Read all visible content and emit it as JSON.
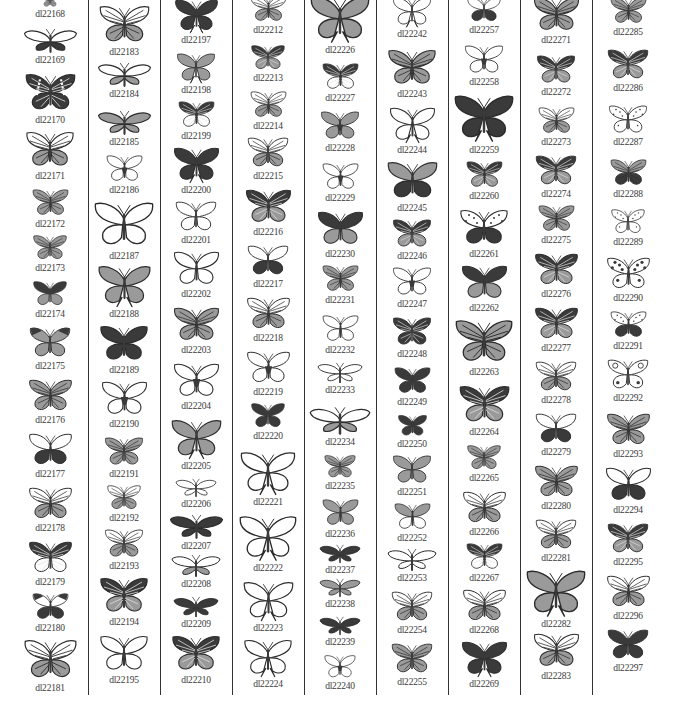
{
  "page": {
    "columns": [
      {
        "items": [
          {
            "id": "dl22168",
            "y": -6,
            "h": 14,
            "style": "pattern"
          },
          {
            "id": "dl22169",
            "y": 28,
            "h": 26,
            "style": "moth-dark"
          },
          {
            "id": "dl22170",
            "y": 72,
            "h": 42,
            "style": "dark-bands"
          },
          {
            "id": "dl22171",
            "y": 130,
            "h": 40,
            "style": "mixed"
          },
          {
            "id": "dl22172",
            "y": 188,
            "h": 30,
            "style": "pattern"
          },
          {
            "id": "dl22173",
            "y": 234,
            "h": 28,
            "style": "pattern"
          },
          {
            "id": "dl22174",
            "y": 280,
            "h": 28,
            "style": "dark-gray"
          },
          {
            "id": "dl22175",
            "y": 326,
            "h": 34,
            "style": "gray-dark-tips"
          },
          {
            "id": "dl22176",
            "y": 378,
            "h": 36,
            "style": "outline-stripe"
          },
          {
            "id": "dl22177",
            "y": 432,
            "h": 36,
            "style": "white-dark-hind"
          },
          {
            "id": "dl22178",
            "y": 486,
            "h": 36,
            "style": "gray-outline"
          },
          {
            "id": "dl22179",
            "y": 540,
            "h": 36,
            "style": "dark-top-white"
          },
          {
            "id": "dl22180",
            "y": 592,
            "h": 30,
            "style": "white-dark"
          },
          {
            "id": "dl22181",
            "y": 638,
            "h": 44,
            "style": "outline-pattern"
          }
        ]
      },
      {
        "items": [
          {
            "id": "dl22183",
            "y": 4,
            "h": 42,
            "style": "outline-pattern"
          },
          {
            "id": "dl22184",
            "y": 62,
            "h": 26,
            "style": "moth-gray"
          },
          {
            "id": "dl22185",
            "y": 110,
            "h": 26,
            "style": "moth-pattern"
          },
          {
            "id": "dl22186",
            "y": 154,
            "h": 30,
            "style": "outline-body"
          },
          {
            "id": "dl22187",
            "y": 200,
            "h": 50,
            "style": "outline"
          },
          {
            "id": "dl22188",
            "y": 264,
            "h": 44,
            "style": "gray-swallow"
          },
          {
            "id": "dl22189",
            "y": 324,
            "h": 40,
            "style": "dark"
          },
          {
            "id": "dl22190",
            "y": 380,
            "h": 38,
            "style": "outline-body"
          },
          {
            "id": "dl22191",
            "y": 436,
            "h": 32,
            "style": "gray-pattern"
          },
          {
            "id": "dl22192",
            "y": 484,
            "h": 28,
            "style": "gray-outline"
          },
          {
            "id": "dl22193",
            "y": 528,
            "h": 32,
            "style": "outline-pattern"
          },
          {
            "id": "dl22194",
            "y": 576,
            "h": 40,
            "style": "dark-pattern"
          },
          {
            "id": "dl22195",
            "y": 634,
            "h": 40,
            "style": "outline"
          }
        ]
      },
      {
        "items": [
          {
            "id": "dl22197",
            "y": -2,
            "h": 36,
            "style": "dark-swallow"
          },
          {
            "id": "dl22198",
            "y": 52,
            "h": 32,
            "style": "gray-swallow"
          },
          {
            "id": "dl22199",
            "y": 100,
            "h": 30,
            "style": "dark-hind-pattern"
          },
          {
            "id": "dl22200",
            "y": 146,
            "h": 38,
            "style": "dark-swallow"
          },
          {
            "id": "dl22201",
            "y": 200,
            "h": 34,
            "style": "outline"
          },
          {
            "id": "dl22202",
            "y": 250,
            "h": 38,
            "style": "outline"
          },
          {
            "id": "dl22203",
            "y": 306,
            "h": 38,
            "style": "gray-pattern"
          },
          {
            "id": "dl22204",
            "y": 362,
            "h": 38,
            "style": "outline-body"
          },
          {
            "id": "dl22205",
            "y": 418,
            "h": 42,
            "style": "gray-swallow"
          },
          {
            "id": "dl22206",
            "y": 478,
            "h": 20,
            "style": "moth-outline"
          },
          {
            "id": "dl22207",
            "y": 514,
            "h": 26,
            "style": "dark-moth"
          },
          {
            "id": "dl22208",
            "y": 554,
            "h": 24,
            "style": "moth-mixed"
          },
          {
            "id": "dl22209",
            "y": 596,
            "h": 22,
            "style": "dark-moth"
          },
          {
            "id": "dl22210",
            "y": 634,
            "h": 40,
            "style": "dark-pattern"
          }
        ]
      },
      {
        "items": [
          {
            "id": "dl22212",
            "y": -6,
            "h": 30,
            "style": "outline-pattern"
          },
          {
            "id": "dl22213",
            "y": 44,
            "h": 28,
            "style": "dark-pattern"
          },
          {
            "id": "dl22214",
            "y": 90,
            "h": 30,
            "style": "mixed"
          },
          {
            "id": "dl22215",
            "y": 136,
            "h": 34,
            "style": "gray-outline"
          },
          {
            "id": "dl22216",
            "y": 188,
            "h": 38,
            "style": "dark-pattern"
          },
          {
            "id": "dl22217",
            "y": 244,
            "h": 34,
            "style": "white-dark-hind"
          },
          {
            "id": "dl22218",
            "y": 296,
            "h": 36,
            "style": "outline-pattern"
          },
          {
            "id": "dl22219",
            "y": 350,
            "h": 36,
            "style": "outline-body"
          },
          {
            "id": "dl22220",
            "y": 402,
            "h": 28,
            "style": "dark"
          },
          {
            "id": "dl22221",
            "y": 450,
            "h": 46,
            "style": "outline-swallow"
          },
          {
            "id": "dl22222",
            "y": 514,
            "h": 48,
            "style": "outline-swallow"
          },
          {
            "id": "dl22223",
            "y": 580,
            "h": 42,
            "style": "outline-swallow"
          },
          {
            "id": "dl22224",
            "y": 638,
            "h": 40,
            "style": "outline-swallow"
          }
        ]
      },
      {
        "items": [
          {
            "id": "dl22226",
            "y": -6,
            "h": 50,
            "style": "gray-swallow"
          },
          {
            "id": "dl22227",
            "y": 62,
            "h": 30,
            "style": "dark-top-white"
          },
          {
            "id": "dl22228",
            "y": 110,
            "h": 32,
            "style": "gray-dark-body"
          },
          {
            "id": "dl22229",
            "y": 162,
            "h": 30,
            "style": "outline-body"
          },
          {
            "id": "dl22230",
            "y": 210,
            "h": 38,
            "style": "dark-gray"
          },
          {
            "id": "dl22231",
            "y": 264,
            "h": 30,
            "style": "gray-pattern"
          },
          {
            "id": "dl22232",
            "y": 314,
            "h": 30,
            "style": "outline"
          },
          {
            "id": "dl22233",
            "y": 362,
            "h": 22,
            "style": "moth-outline"
          },
          {
            "id": "dl22234",
            "y": 406,
            "h": 30,
            "style": "moth-mixed"
          },
          {
            "id": "dl22235",
            "y": 454,
            "h": 26,
            "style": "gray-pattern"
          },
          {
            "id": "dl22236",
            "y": 498,
            "h": 30,
            "style": "gray"
          },
          {
            "id": "dl22237",
            "y": 544,
            "h": 20,
            "style": "dark-moth"
          },
          {
            "id": "dl22238",
            "y": 578,
            "h": 20,
            "style": "moth-pattern"
          },
          {
            "id": "dl22239",
            "y": 616,
            "h": 20,
            "style": "dark-moth"
          },
          {
            "id": "dl22240",
            "y": 654,
            "h": 26,
            "style": "outline-body"
          }
        ]
      },
      {
        "items": [
          {
            "id": "dl22242",
            "y": -4,
            "h": 32,
            "style": "outline-swallow"
          },
          {
            "id": "dl22243",
            "y": 48,
            "h": 40,
            "style": "gray-pattern"
          },
          {
            "id": "dl22244",
            "y": 106,
            "h": 38,
            "style": "outline-swallow"
          },
          {
            "id": "dl22245",
            "y": 160,
            "h": 42,
            "style": "gray-dark-hind"
          },
          {
            "id": "dl22246",
            "y": 218,
            "h": 32,
            "style": "dark-pattern"
          },
          {
            "id": "dl22247",
            "y": 266,
            "h": 32,
            "style": "outline-body"
          },
          {
            "id": "dl22248",
            "y": 316,
            "h": 32,
            "style": "dark-stripe"
          },
          {
            "id": "dl22249",
            "y": 366,
            "h": 30,
            "style": "dark"
          },
          {
            "id": "dl22250",
            "y": 414,
            "h": 24,
            "style": "dark"
          },
          {
            "id": "dl22251",
            "y": 454,
            "h": 32,
            "style": "gray"
          },
          {
            "id": "dl22252",
            "y": 502,
            "h": 30,
            "style": "gray-top-white"
          },
          {
            "id": "dl22253",
            "y": 548,
            "h": 24,
            "style": "moth-outline"
          },
          {
            "id": "dl22254",
            "y": 590,
            "h": 34,
            "style": "mixed"
          },
          {
            "id": "dl22255",
            "y": 642,
            "h": 34,
            "style": "pattern"
          }
        ]
      },
      {
        "items": [
          {
            "id": "dl22257",
            "y": -4,
            "h": 28,
            "style": "white-dark-hind"
          },
          {
            "id": "dl22258",
            "y": 44,
            "h": 32,
            "style": "outline-body"
          },
          {
            "id": "dl22259",
            "y": 92,
            "h": 52,
            "style": "dark-swallow"
          },
          {
            "id": "dl22260",
            "y": 160,
            "h": 30,
            "style": "dark-pattern"
          },
          {
            "id": "dl22261",
            "y": 208,
            "h": 40,
            "style": "dotted-dark-hind"
          },
          {
            "id": "dl22262",
            "y": 264,
            "h": 38,
            "style": "dark-gray"
          },
          {
            "id": "dl22263",
            "y": 318,
            "h": 48,
            "style": "pattern"
          },
          {
            "id": "dl22264",
            "y": 384,
            "h": 42,
            "style": "dark-pattern"
          },
          {
            "id": "dl22265",
            "y": 444,
            "h": 28,
            "style": "gray-pattern"
          },
          {
            "id": "dl22266",
            "y": 490,
            "h": 36,
            "style": "outline-pattern"
          },
          {
            "id": "dl22267",
            "y": 542,
            "h": 30,
            "style": "dark-top-white"
          },
          {
            "id": "dl22268",
            "y": 588,
            "h": 36,
            "style": "gray-outline"
          },
          {
            "id": "dl22269",
            "y": 640,
            "h": 38,
            "style": "dark-swallow"
          }
        ]
      },
      {
        "items": [
          {
            "id": "dl22271",
            "y": -4,
            "h": 38,
            "style": "pattern"
          },
          {
            "id": "dl22272",
            "y": 54,
            "h": 32,
            "style": "dark-pattern"
          },
          {
            "id": "dl22273",
            "y": 106,
            "h": 30,
            "style": "mixed"
          },
          {
            "id": "dl22274",
            "y": 154,
            "h": 34,
            "style": "dark-pattern"
          },
          {
            "id": "dl22275",
            "y": 204,
            "h": 30,
            "style": "pattern"
          },
          {
            "id": "dl22276",
            "y": 252,
            "h": 36,
            "style": "dark-pattern"
          },
          {
            "id": "dl22277",
            "y": 306,
            "h": 36,
            "style": "dark-pattern"
          },
          {
            "id": "dl22278",
            "y": 360,
            "h": 34,
            "style": "outline-pattern"
          },
          {
            "id": "dl22279",
            "y": 412,
            "h": 34,
            "style": "white-dark-hind"
          },
          {
            "id": "dl22280",
            "y": 464,
            "h": 36,
            "style": "gray-pattern"
          },
          {
            "id": "dl22281",
            "y": 518,
            "h": 34,
            "style": "gray-outline"
          },
          {
            "id": "dl22282",
            "y": 568,
            "h": 50,
            "style": "gray-swallow"
          },
          {
            "id": "dl22283",
            "y": 632,
            "h": 38,
            "style": "outline-pattern"
          }
        ]
      },
      {
        "items": [
          {
            "id": "dl22285",
            "y": -4,
            "h": 30,
            "style": "pattern"
          },
          {
            "id": "dl22286",
            "y": 48,
            "h": 34,
            "style": "dark-pattern"
          },
          {
            "id": "dl22287",
            "y": 104,
            "h": 32,
            "style": "dotted"
          },
          {
            "id": "dl22288",
            "y": 158,
            "h": 30,
            "style": "gray-dark"
          },
          {
            "id": "dl22289",
            "y": 208,
            "h": 28,
            "style": "dotted"
          },
          {
            "id": "dl22290",
            "y": 256,
            "h": 36,
            "style": "dotted-dark"
          },
          {
            "id": "dl22291",
            "y": 310,
            "h": 30,
            "style": "dotted-dark-hind"
          },
          {
            "id": "dl22292",
            "y": 358,
            "h": 34,
            "style": "outline-eyes"
          },
          {
            "id": "dl22293",
            "y": 412,
            "h": 36,
            "style": "pattern"
          },
          {
            "id": "dl22294",
            "y": 466,
            "h": 38,
            "style": "white-dark-hind"
          },
          {
            "id": "dl22295",
            "y": 522,
            "h": 34,
            "style": "dark-pattern"
          },
          {
            "id": "dl22296",
            "y": 574,
            "h": 36,
            "style": "mixed"
          },
          {
            "id": "dl22297",
            "y": 628,
            "h": 34,
            "style": "dark"
          }
        ]
      }
    ],
    "colors": {
      "dark": "#3a3a3a",
      "gray": "#9a9a9a",
      "light": "#ffffff",
      "line": "#2b2b2b",
      "label": "#3a3a3a"
    }
  }
}
